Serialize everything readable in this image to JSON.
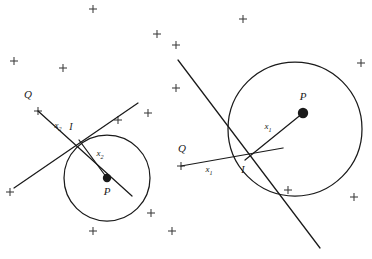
{
  "figure": {
    "background_color": "#ffffff",
    "stroke_color": "#1a1a1a",
    "marker_color": "#3a3a3a",
    "width": 372,
    "height": 259
  },
  "panels": [
    {
      "id": "left-panel",
      "name": "left-diagram",
      "circle": {
        "cx": 107,
        "cy": 178,
        "r": 43,
        "stroke": "#1a1a1a"
      },
      "center_point": {
        "label": "P",
        "x": 107,
        "y": 178,
        "dot_radius": 4.2,
        "label_x": 107,
        "label_y": 195
      },
      "intersection_point": {
        "label": "I",
        "x": 79,
        "y": 140,
        "label_x": 71,
        "label_y": 130
      },
      "radius_label": {
        "text": "x",
        "sub": "2",
        "x": 100,
        "y": 156
      },
      "q_label": {
        "text": "Q",
        "x": 28,
        "y": 98
      },
      "q_marker": {
        "x": 38,
        "y": 111
      },
      "segment_label": {
        "text": "x",
        "sub": "2",
        "x": 58,
        "y": 128
      },
      "lines": [
        {
          "name": "q-ray-line",
          "x1": 38,
          "y1": 111,
          "x2": 132,
          "y2": 196
        },
        {
          "name": "second-line",
          "x1": 14,
          "y1": 188,
          "x2": 138,
          "y2": 103
        }
      ]
    },
    {
      "id": "right-panel",
      "name": "right-diagram",
      "circle": {
        "cx": 295,
        "cy": 129,
        "r": 67,
        "stroke": "#1a1a1a"
      },
      "center_point": {
        "label": "P",
        "x": 303,
        "y": 113,
        "dot_radius": 5.2,
        "label_x": 303,
        "label_y": 100
      },
      "intersection_point": {
        "label": "I",
        "x": 245,
        "y": 160,
        "label_x": 243,
        "label_y": 173
      },
      "radius_label": {
        "text": "x",
        "sub": "1",
        "x": 268,
        "y": 129
      },
      "q_label": {
        "text": "Q",
        "x": 182,
        "y": 152
      },
      "q_marker": {
        "x": 181,
        "y": 166
      },
      "segment_label": {
        "text": "x",
        "sub": "1",
        "x": 209,
        "y": 172
      },
      "lines": [
        {
          "name": "q-ray-line",
          "x1": 181,
          "y1": 166,
          "x2": 283,
          "y2": 148
        },
        {
          "name": "second-line",
          "x1": 178,
          "y1": 60,
          "x2": 320,
          "y2": 248
        }
      ]
    }
  ],
  "markers": {
    "glyph": "+",
    "size": 8,
    "points": [
      {
        "x": 93,
        "y": 9
      },
      {
        "x": 157,
        "y": 34
      },
      {
        "x": 176,
        "y": 45
      },
      {
        "x": 243,
        "y": 19
      },
      {
        "x": 14,
        "y": 61
      },
      {
        "x": 63,
        "y": 68
      },
      {
        "x": 176,
        "y": 88
      },
      {
        "x": 361,
        "y": 63
      },
      {
        "x": 38,
        "y": 111
      },
      {
        "x": 118,
        "y": 120
      },
      {
        "x": 148,
        "y": 113
      },
      {
        "x": 181,
        "y": 166
      },
      {
        "x": 10,
        "y": 192
      },
      {
        "x": 151,
        "y": 213
      },
      {
        "x": 93,
        "y": 231
      },
      {
        "x": 172,
        "y": 231
      },
      {
        "x": 288,
        "y": 190
      },
      {
        "x": 354,
        "y": 197
      }
    ]
  },
  "caption": {
    "visible": false,
    "text": ""
  }
}
